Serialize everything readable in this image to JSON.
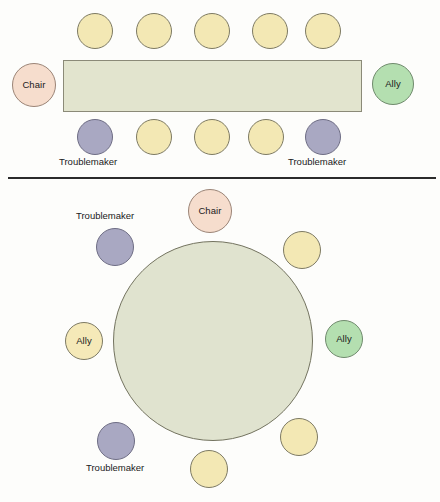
{
  "diagram": {
    "background_color": "#fdfdfb",
    "colors": {
      "table_rect_fill": "#e2e4ce",
      "table_rect_border": "#8b8a78",
      "table_round_fill": "#e0e3cf",
      "table_round_border": "#73735f",
      "seat_empty": "#f3e8b4",
      "seat_chair": "#f6ddcd",
      "seat_ally_green": "#b4dfb0",
      "seat_ally_yellow": "#f5e9b8",
      "seat_troublemaker": "#a9a8c2",
      "divider": "#2b2b2b"
    }
  },
  "rect_layout": {
    "name": "rectangular-table-layout",
    "table": {
      "x": 63,
      "y": 60,
      "width": 299,
      "height": 52
    },
    "seats": [
      {
        "id": "rect-top-1",
        "label": "",
        "role": "empty",
        "x": 77,
        "y": 13,
        "size": 36
      },
      {
        "id": "rect-top-2",
        "label": "",
        "role": "empty",
        "x": 136,
        "y": 13,
        "size": 36
      },
      {
        "id": "rect-top-3",
        "label": "",
        "role": "empty",
        "x": 194,
        "y": 13,
        "size": 36
      },
      {
        "id": "rect-top-4",
        "label": "",
        "role": "empty",
        "x": 252,
        "y": 13,
        "size": 36
      },
      {
        "id": "rect-top-5",
        "label": "",
        "role": "empty",
        "x": 305,
        "y": 13,
        "size": 36
      },
      {
        "id": "rect-left-chair",
        "label": "Chair",
        "role": "chair",
        "x": 12,
        "y": 63,
        "size": 44
      },
      {
        "id": "rect-right-ally",
        "label": "Ally",
        "role": "ally-green",
        "x": 372,
        "y": 63,
        "size": 42
      },
      {
        "id": "rect-bot-1",
        "label": "",
        "role": "troublemaker",
        "x": 77,
        "y": 119,
        "size": 36
      },
      {
        "id": "rect-bot-2",
        "label": "",
        "role": "empty",
        "x": 136,
        "y": 119,
        "size": 36
      },
      {
        "id": "rect-bot-3",
        "label": "",
        "role": "empty",
        "x": 194,
        "y": 119,
        "size": 36
      },
      {
        "id": "rect-bot-4",
        "label": "",
        "role": "empty",
        "x": 248,
        "y": 119,
        "size": 36
      },
      {
        "id": "rect-bot-5",
        "label": "",
        "role": "troublemaker",
        "x": 305,
        "y": 119,
        "size": 36
      }
    ],
    "labels": [
      {
        "id": "rect-label-trouble-left",
        "text": "Troublemaker",
        "x": 59,
        "y": 157
      },
      {
        "id": "rect-label-trouble-right",
        "text": "Troublemaker",
        "x": 288,
        "y": 157
      }
    ]
  },
  "round_layout": {
    "name": "round-table-layout",
    "table": {
      "cx": 213,
      "cy": 341,
      "r": 100
    },
    "seats": [
      {
        "id": "round-chair",
        "label": "Chair",
        "role": "chair",
        "x": 188,
        "y": 189,
        "size": 44
      },
      {
        "id": "round-upper-right",
        "label": "",
        "role": "empty",
        "x": 283,
        "y": 231,
        "size": 38
      },
      {
        "id": "round-right-ally",
        "label": "Ally",
        "role": "ally-green",
        "x": 325,
        "y": 320,
        "size": 38
      },
      {
        "id": "round-lower-right",
        "label": "",
        "role": "empty",
        "x": 280,
        "y": 418,
        "size": 38
      },
      {
        "id": "round-bottom",
        "label": "",
        "role": "empty",
        "x": 190,
        "y": 450,
        "size": 38
      },
      {
        "id": "round-lower-left",
        "label": "",
        "role": "troublemaker",
        "x": 97,
        "y": 422,
        "size": 38
      },
      {
        "id": "round-left-ally",
        "label": "Ally",
        "role": "ally-yellow",
        "x": 65,
        "y": 322,
        "size": 38
      },
      {
        "id": "round-upper-left",
        "label": "",
        "role": "troublemaker",
        "x": 96,
        "y": 228,
        "size": 38
      }
    ],
    "labels": [
      {
        "id": "round-label-trouble-top",
        "text": "Troublemaker",
        "x": 76,
        "y": 211
      },
      {
        "id": "round-label-trouble-bottom",
        "text": "Troublemaker",
        "x": 86,
        "y": 463
      }
    ]
  },
  "divider": {
    "x": 8,
    "y": 177,
    "width": 428,
    "height": 2
  }
}
